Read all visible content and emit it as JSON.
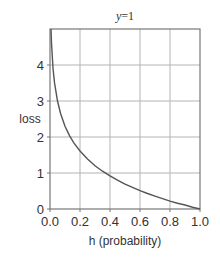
{
  "chart_data": {
    "type": "line",
    "title_var": "y",
    "title_rest": "=1",
    "xlabel": "h (probability)",
    "ylabel": "loss",
    "xlim": [
      0.0,
      1.0
    ],
    "ylim": [
      0,
      5
    ],
    "x_ticks": [
      "0.0",
      "0.2",
      "0.4",
      "0.6",
      "0.8",
      "1.0"
    ],
    "x_tick_values": [
      0.0,
      0.2,
      0.4,
      0.6,
      0.8,
      1.0
    ],
    "y_ticks": [
      "0",
      "1",
      "2",
      "3",
      "4"
    ],
    "y_tick_values": [
      0,
      1,
      2,
      3,
      4
    ],
    "grid": true,
    "series": [
      {
        "name": "-log(h)",
        "function": "-ln(h)",
        "x": [
          0.0067,
          0.01,
          0.02,
          0.03,
          0.05,
          0.07,
          0.1,
          0.13,
          0.16,
          0.2,
          0.25,
          0.3,
          0.35,
          0.4,
          0.45,
          0.5,
          0.55,
          0.6,
          0.65,
          0.7,
          0.75,
          0.8,
          0.85,
          0.9,
          0.95,
          1.0
        ],
        "y": [
          5.0,
          4.61,
          3.91,
          3.51,
          3.0,
          2.66,
          2.3,
          2.04,
          1.83,
          1.61,
          1.39,
          1.2,
          1.05,
          0.92,
          0.8,
          0.69,
          0.6,
          0.51,
          0.43,
          0.36,
          0.29,
          0.22,
          0.16,
          0.11,
          0.05,
          0.0
        ],
        "color": "#555555"
      }
    ]
  },
  "colors": {
    "grid": "#b3b3b3",
    "frame": "#777777",
    "curve": "#555555",
    "text": "#333333"
  }
}
